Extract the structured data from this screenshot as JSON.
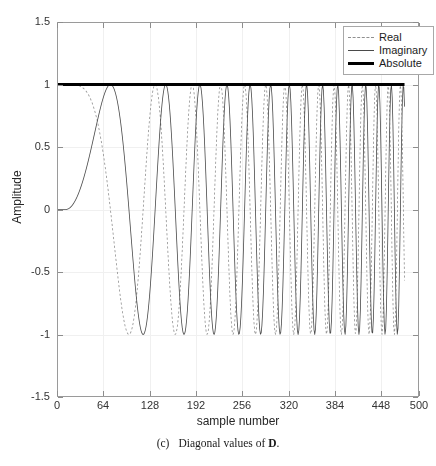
{
  "figure": {
    "caption_tag": "(c)",
    "caption_text": "Diagonal values of",
    "caption_symbol": "D",
    "caption_period": "."
  },
  "axes": {
    "xlabel": "sample number",
    "ylabel": "Amplitude",
    "xticks": [
      "0",
      "64",
      "128",
      "192",
      "256",
      "320",
      "384",
      "448",
      "500"
    ],
    "yticks": [
      "1.5",
      "1",
      "0.5",
      "0",
      "-0.5",
      "-1",
      "-1.5"
    ]
  },
  "legend": {
    "position": "top-right",
    "entries": [
      {
        "label": "Real",
        "style": "dashed",
        "color": "#8f8f8f",
        "icon": "dashed-line-icon"
      },
      {
        "label": "Imaginary",
        "style": "solid-thin",
        "color": "#4a4a4a",
        "icon": "solid-line-icon"
      },
      {
        "label": "Absolute",
        "style": "solid-thick",
        "color": "#000000",
        "icon": "thick-line-icon"
      }
    ]
  },
  "chart_data": {
    "type": "line",
    "title": "",
    "subtitle": "",
    "xlabel": "sample number",
    "ylabel": "Amplitude",
    "xlim": [
      0,
      500
    ],
    "ylim": [
      -1.5,
      1.5
    ],
    "xticks": [
      0,
      64,
      128,
      192,
      256,
      320,
      384,
      448,
      500
    ],
    "yticks": [
      1.5,
      1,
      0.5,
      0,
      -0.5,
      -1,
      -1.5
    ],
    "grid": true,
    "legend_position": "upper right",
    "annotations": [],
    "n_samples": 480,
    "signal_model": {
      "description": "Complex chirp: exp(j*pi*k*n^2/N) sampled at integer n; quadratic (linearly sweeping) instantaneous frequency, unit magnitude",
      "chirp_rate_k": 0.000131,
      "phase_formula": "phi(n) = pi * chirp_rate_k * n^2",
      "start_flat_samples": 12
    },
    "series": [
      {
        "name": "Real",
        "style": "dashed",
        "color": "#8f8f8f",
        "linewidth": 0.8,
        "formula": "cos(phi(n))",
        "ymin": -1.0,
        "ymax": 1.0,
        "note": "Aliased envelope: hugs +1 at low n, dips progressively deeper as instantaneous frequency increases"
      },
      {
        "name": "Imaginary",
        "style": "solid",
        "color": "#4a4a4a",
        "linewidth": 0.8,
        "formula": "sin(phi(n))",
        "ymin": -1.0,
        "ymax": 1.0,
        "note": "Starts near 0, sawtooth-like aliased oscillation growing to full +/-1 swing"
      },
      {
        "name": "Absolute",
        "style": "solid",
        "color": "#000000",
        "linewidth": 3.0,
        "formula": "abs(exp(j*phi(n))) = 1",
        "constant_value": 1.0,
        "ymin": 1.0,
        "ymax": 1.0,
        "note": "Flat horizontal line at amplitude 1 across all samples"
      }
    ]
  }
}
